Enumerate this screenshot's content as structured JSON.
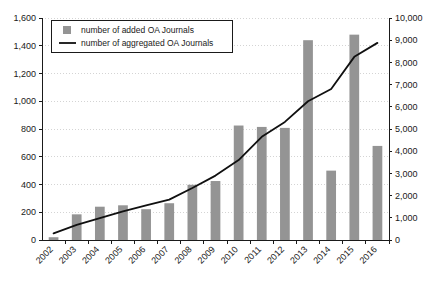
{
  "chart_data": {
    "type": "bar",
    "title": "",
    "subtitle": "",
    "xlabel": "",
    "ylabel": "",
    "y2label": "",
    "grid": true,
    "legend_position": "top-left",
    "categories": [
      "2002",
      "2003",
      "2004",
      "2005",
      "2006",
      "2007",
      "2008",
      "2009",
      "2010",
      "2011",
      "2012",
      "2013",
      "2014",
      "2015",
      "2016"
    ],
    "left_axis": {
      "min": 0,
      "max": 1600,
      "tick_step": 200,
      "ticks": [
        "0",
        "200",
        "400",
        "600",
        "800",
        "1,000",
        "1,200",
        "1,400",
        "1,600"
      ],
      "tick_values": [
        0,
        200,
        400,
        600,
        800,
        1000,
        1200,
        1400,
        1600
      ]
    },
    "right_axis": {
      "min": 0,
      "max": 10000,
      "tick_step": 1000,
      "ticks": [
        "0",
        "1,000",
        "2,000",
        "3,000",
        "4,000",
        "5,000",
        "6,000",
        "7,000",
        "8,000",
        "9,000",
        "10,000"
      ],
      "tick_values": [
        0,
        1000,
        2000,
        3000,
        4000,
        5000,
        6000,
        7000,
        8000,
        9000,
        10000
      ]
    },
    "series": [
      {
        "name": "number of added OA Journals",
        "type": "bar",
        "axis": "left",
        "color": "#949494",
        "values": [
          20,
          185,
          240,
          250,
          222,
          265,
          398,
          425,
          825,
          815,
          808,
          1440,
          500,
          1480,
          678
        ]
      },
      {
        "name": "number of aggregated OA Journals",
        "type": "line",
        "axis": "right",
        "color": "#101010",
        "values": [
          300,
          680,
          990,
          1290,
          1560,
          1820,
          2340,
          2900,
          3600,
          4650,
          5320,
          6250,
          6800,
          8250,
          8880
        ]
      }
    ]
  },
  "legend": {
    "items": [
      {
        "label": "number of added OA Journals",
        "marker": "square-marker",
        "color": "#949494"
      },
      {
        "label": "number of aggregated OA Journals",
        "marker": "line-marker",
        "color": "#101010"
      }
    ]
  },
  "colors": {
    "bar": "#949494",
    "line": "#101010",
    "axis": "#1a1a1a",
    "grid": "#c9c9c9",
    "background": "#ffffff"
  }
}
